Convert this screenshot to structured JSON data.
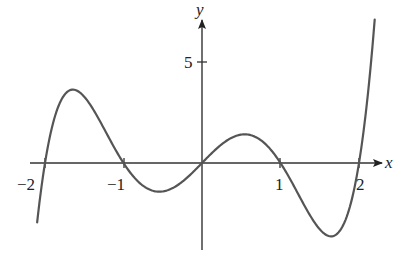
{
  "chart_data": {
    "type": "line",
    "title": "",
    "xlabel": "x",
    "ylabel": "y",
    "xlim": [
      -2.1,
      2.2
    ],
    "ylim": [
      -4.4,
      7.1
    ],
    "x_ticks": [
      -2,
      -1,
      1,
      2
    ],
    "x_tick_labels": [
      "−2",
      "−1",
      "1",
      "2"
    ],
    "y_ticks": [
      5
    ],
    "y_tick_labels": [
      "5"
    ],
    "grid": false,
    "legend": null,
    "series": [
      {
        "name": "f(x)",
        "description": "Quintic curve with zeros at x = -2, -1, 0, 1, 2 (shape of x(x^2-1)(x^2-4))",
        "x": [
          -2.1,
          -2.0,
          -1.8,
          -1.64,
          -1.5,
          -1.2,
          -1.0,
          -0.8,
          -0.54,
          -0.3,
          0.0,
          0.3,
          0.54,
          0.8,
          1.0,
          1.2,
          1.5,
          1.64,
          1.8,
          2.0,
          2.2
        ],
        "y": [
          -2.94,
          0.0,
          2.95,
          3.63,
          3.28,
          1.38,
          0.0,
          -1.0,
          -1.42,
          -1.07,
          0.0,
          1.07,
          1.42,
          1.0,
          0.0,
          -1.38,
          -3.28,
          -3.63,
          -2.95,
          0.0,
          7.1
        ]
      }
    ],
    "key_points": {
      "local_max_left": [
        -1.64,
        3.63
      ],
      "local_min_left": [
        -0.54,
        -1.42
      ],
      "local_max_right": [
        0.54,
        1.42
      ],
      "local_min_right": [
        1.64,
        -3.63
      ],
      "zeros": [
        -2,
        -1,
        0,
        1,
        2
      ]
    }
  },
  "axes": {
    "x_label": "x",
    "y_label": "y",
    "tick_labels": {
      "neg2": "−2",
      "neg1": "−1",
      "pos1": "1",
      "pos2": "2",
      "y5": "5"
    }
  }
}
